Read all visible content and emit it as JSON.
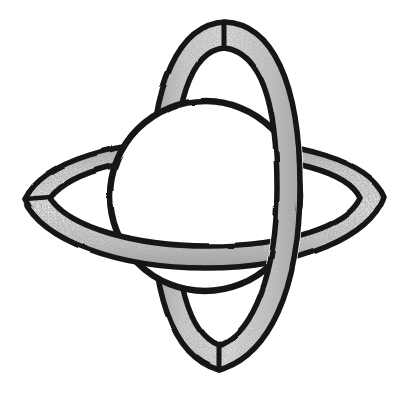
{
  "artwork": {
    "title": "Interlocking Orbital Rings with Central Sphere",
    "medium": "hand-drawn pencil and ink sketch",
    "style": "monochrome line drawing with graphite shading",
    "background_color": "#ffffff",
    "ink_color": "#151515",
    "band_fill_color": "#f4f4f4",
    "shading_color": "#8b8b8b",
    "canvas": {
      "width": 410,
      "height": 400
    }
  },
  "composition": {
    "elements": [
      {
        "name": "vertical-ring",
        "label": "Vertical ribbon ring",
        "orientation": "vertical",
        "shape": "elongated ellipse band with pointed top and bottom vertices",
        "bounds": {
          "x": 150,
          "y": 20,
          "width": 150,
          "height": 352
        },
        "top_vertex": {
          "x": 225,
          "y": 22
        },
        "bottom_vertex": {
          "x": 219,
          "y": 370
        },
        "band_width": 26,
        "depth": "front-right, passes over sphere and over horizontal ring at right"
      },
      {
        "name": "horizontal-ring",
        "label": "Horizontal ribbon ring",
        "orientation": "horizontal",
        "shape": "flattened ellipse band seen nearly edge-on, pointed left and right vertices",
        "bounds": {
          "x": 22,
          "y": 140,
          "width": 363,
          "height": 130
        },
        "left_vertex": {
          "x": 24,
          "y": 200
        },
        "right_vertex": {
          "x": 384,
          "y": 196
        },
        "band_width": 24,
        "depth": "front-bottom, passes over sphere at bottom and under vertical ring at right"
      },
      {
        "name": "central-sphere",
        "label": "Central sphere",
        "shape": "circle with heavy ink outline, unshaded white interior",
        "center": {
          "x": 205,
          "y": 196
        },
        "radius": 95,
        "fill": "#ffffff",
        "depth": "behind both ribbon bands at their front crossings"
      }
    ],
    "crossings": [
      {
        "name": "right-crossing",
        "at": {
          "x": 300,
          "y": 200
        },
        "over": "vertical-ring",
        "under": "horizontal-ring"
      },
      {
        "name": "bottom-crossing",
        "at": {
          "x": 212,
          "y": 262
        },
        "over": "horizontal-ring",
        "under": "vertical-ring"
      },
      {
        "name": "sphere-right-occlusion",
        "at": {
          "x": 285,
          "y": 190
        },
        "over": "vertical-ring",
        "under": "central-sphere"
      },
      {
        "name": "sphere-bottom-occlusion",
        "at": {
          "x": 205,
          "y": 258
        },
        "over": "horizontal-ring",
        "under": "central-sphere"
      }
    ]
  },
  "geometry": {
    "vertical_ring": {
      "outer_path": "M 225 22 C 272 24 300 82 300 186 C 300 292 268 356 219 370 C 171 356 151 292 151 186 C 151 84 179 24 225 22 Z",
      "inner_path": "M 224 48 C 261 52 277 104 277 188 C 277 278 251 334 219 346 C 188 334 174 278 174 188 C 174 106 190 51 224 48 Z"
    },
    "horizontal_ring": {
      "outer_path": "M 24 200 C 44 160 118 140 206 140 C 300 140 370 162 384 196 C 372 236 300 268 206 268 C 116 268 42 240 24 200 Z",
      "inner_path": "M 50 198 C 72 170 134 156 208 156 C 290 156 348 172 360 198 C 348 226 288 246 208 246 C 132 246 68 226 50 198 Z"
    },
    "sphere": {
      "circle": {
        "cx": 205,
        "cy": 196,
        "r": 95
      }
    }
  }
}
